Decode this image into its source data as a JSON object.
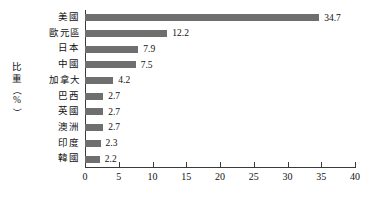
{
  "chart_data": {
    "type": "bar",
    "orientation": "horizontal",
    "title": "",
    "xlabel": "",
    "ylabel": "比重（%）",
    "categories": [
      "美國",
      "歐元區",
      "日本",
      "中國",
      "加拿大",
      "巴西",
      "英國",
      "澳洲",
      "印度",
      "韓國"
    ],
    "values": [
      34.7,
      12.2,
      7.9,
      7.5,
      4.2,
      2.7,
      2.7,
      2.7,
      2.3,
      2.2
    ],
    "value_labels": [
      "34.7",
      "12.2",
      "7.9",
      "7.5",
      "4.2",
      "2.7",
      "2.7",
      "2.7",
      "2.3",
      "2.2"
    ],
    "xlim": [
      0,
      40
    ],
    "xticks": [
      0,
      5,
      10,
      15,
      20,
      25,
      30,
      35,
      40
    ],
    "xtick_labels": [
      "0",
      "5",
      "10",
      "15",
      "20",
      "25",
      "30",
      "35",
      "40"
    ],
    "grid": false,
    "legend": null,
    "bar_color": "#6f6f6f",
    "axis_color": "#3a3a3a",
    "text_color": "#111111",
    "background": "#ffffff"
  },
  "axis_title": {
    "chars": [
      "比",
      "重"
    ],
    "paren_open": "（",
    "percent": "%",
    "paren_close": "）"
  }
}
